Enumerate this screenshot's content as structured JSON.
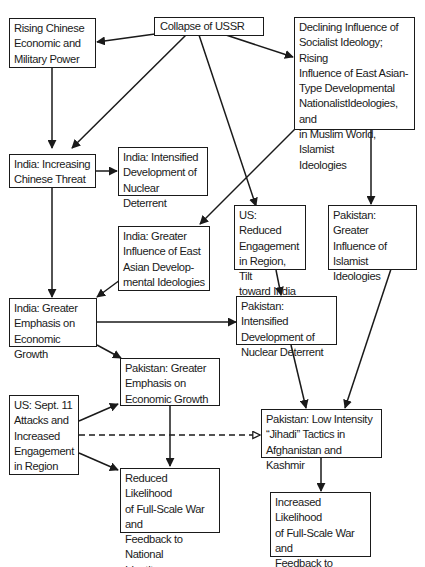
{
  "diagram": {
    "nodes": [
      {
        "id": "collapse_ussr",
        "label": "Collapse of USSR"
      },
      {
        "id": "rising_chinese",
        "label": "Rising Chinese\nEconomic and\nMilitary Power"
      },
      {
        "id": "declining_socialist",
        "label": "Declining Influence of\nSocialist Ideology; Rising\nInfluence of East Asian-\nType Developmental\nNationalistIdeologies, and\nin Muslim World, Islamist\nIdeologies"
      },
      {
        "id": "india_chinese_threat",
        "label": "India: Increasing\nChinese Threat"
      },
      {
        "id": "india_nuclear",
        "label": "India: Intensified\nDevelopment of\nNuclear Deterrent"
      },
      {
        "id": "india_east_asian",
        "label": "India: Greater\nInfluence of East\nAsian Develop-\nmental Ideologies"
      },
      {
        "id": "us_reduced",
        "label": "US: Reduced\nEngagement\nin Region, Tilt\ntoward India"
      },
      {
        "id": "pakistan_islamist",
        "label": "Pakistan: Greater\nInfluence of\nIslamist\nIdeologies"
      },
      {
        "id": "india_growth",
        "label": "India: Greater\nEmphasis on\nEconomic Growth"
      },
      {
        "id": "pakistan_nuclear",
        "label": "Pakistan: Intensified\nDevelopment of\nNuclear Deterrent"
      },
      {
        "id": "pakistan_growth",
        "label": "Pakistan: Greater\nEmphasis on\nEconomic Growth"
      },
      {
        "id": "us_sept11",
        "label": "US: Sept. 11\nAttacks and\nIncreased\nEngagement\nin Region"
      },
      {
        "id": "pakistan_jihadi",
        "label": "Pakistan: Low Intensity\n“Jihadi” Tactics in\nAfghanistan and Kashmir"
      },
      {
        "id": "reduced_war",
        "label": "Reduced Likelihood\nof Full-Scale War and\nFeedback to National\nIdentity"
      },
      {
        "id": "increased_war",
        "label": "Increased Likelihood\nof Full-Scale War and\nFeedback to National\nIdentity"
      }
    ],
    "edges": [
      {
        "from": "collapse_ussr",
        "to": "rising_chinese",
        "style": "solid"
      },
      {
        "from": "collapse_ussr",
        "to": "india_chinese_threat",
        "style": "solid"
      },
      {
        "from": "collapse_ussr",
        "to": "us_reduced",
        "style": "solid"
      },
      {
        "from": "collapse_ussr",
        "to": "declining_socialist",
        "style": "solid"
      },
      {
        "from": "rising_chinese",
        "to": "india_chinese_threat",
        "style": "solid"
      },
      {
        "from": "india_chinese_threat",
        "to": "india_nuclear",
        "style": "solid"
      },
      {
        "from": "india_chinese_threat",
        "to": "india_growth",
        "style": "solid"
      },
      {
        "from": "declining_socialist",
        "to": "india_east_asian",
        "style": "solid"
      },
      {
        "from": "declining_socialist",
        "to": "pakistan_islamist",
        "style": "solid"
      },
      {
        "from": "india_east_asian",
        "to": "india_growth",
        "style": "solid"
      },
      {
        "from": "us_reduced",
        "to": "pakistan_nuclear",
        "style": "solid"
      },
      {
        "from": "india_growth",
        "to": "pakistan_nuclear",
        "style": "solid"
      },
      {
        "from": "india_growth",
        "to": "pakistan_growth",
        "style": "solid"
      },
      {
        "from": "pakistan_nuclear",
        "to": "pakistan_jihadi",
        "style": "solid"
      },
      {
        "from": "pakistan_islamist",
        "to": "pakistan_jihadi",
        "style": "solid"
      },
      {
        "from": "us_sept11",
        "to": "pakistan_growth",
        "style": "solid"
      },
      {
        "from": "us_sept11",
        "to": "reduced_war",
        "style": "solid"
      },
      {
        "from": "us_sept11",
        "to": "pakistan_jihadi",
        "style": "dashed"
      },
      {
        "from": "pakistan_growth",
        "to": "reduced_war",
        "style": "solid"
      },
      {
        "from": "pakistan_jihadi",
        "to": "increased_war",
        "style": "solid"
      }
    ]
  }
}
